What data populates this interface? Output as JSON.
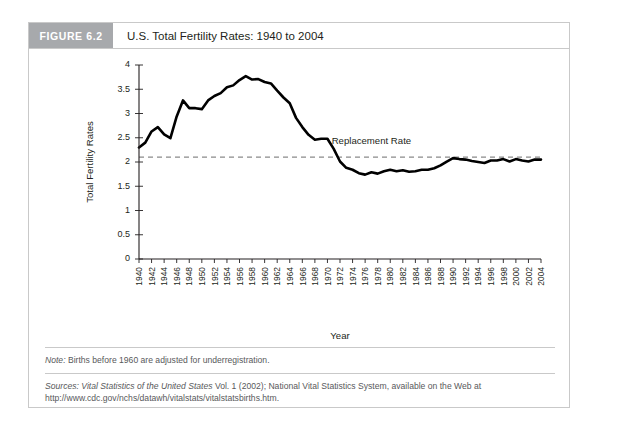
{
  "figure": {
    "badge": "FIGURE 6.2",
    "title": "U.S. Total Fertility Rates: 1940 to 2004",
    "note_label": "Note:",
    "note_text": " Births before 1960 are adjusted for underregistration.",
    "sources_label": "Sources:",
    "sources_italic": " Vital Statistics of the United States",
    "sources_text": " Vol. 1 (2002); National Vital Statistics System, available on the Web at http://www.cdc.gov/nchs/datawh/vitalstats/vitalstatsbirths.htm.",
    "badge_color": "#a7a9ac",
    "line_color": "#000000",
    "ref_line_color": "#8a8a8a"
  },
  "chart_data": {
    "type": "line",
    "title": "U.S. Total Fertility Rates: 1940 to 2004",
    "xlabel": "Year",
    "ylabel": "Total Fertility Rates",
    "xlim": [
      1940,
      2004
    ],
    "ylim": [
      0,
      4
    ],
    "yticks": [
      0,
      0.5,
      1,
      1.5,
      2,
      2.5,
      3,
      3.5,
      4
    ],
    "ytick_labels": [
      "0",
      "0.5",
      "1",
      "1.5",
      "2",
      "2.5",
      "3",
      "3.5",
      "4"
    ],
    "xticks": [
      1940,
      1941,
      1942,
      1943,
      1944,
      1945,
      1946,
      1947,
      1948,
      1949,
      1950,
      1951,
      1952,
      1953,
      1954,
      1955,
      1956,
      1957,
      1958,
      1959,
      1960,
      1961,
      1962,
      1963,
      1964,
      1965,
      1966,
      1967,
      1968,
      1969,
      1970,
      1971,
      1972,
      1973,
      1974,
      1975,
      1976,
      1977,
      1978,
      1979,
      1980,
      1981,
      1982,
      1983,
      1984,
      1985,
      1986,
      1987,
      1988,
      1989,
      1990,
      1991,
      1992,
      1993,
      1994,
      1995,
      1996,
      1997,
      1998,
      1999,
      2000,
      2001,
      2002,
      2003,
      2004
    ],
    "xtick_labels": [
      "1940",
      "1942",
      "1944",
      "1946",
      "1948",
      "1950",
      "1952",
      "1954",
      "1956",
      "1958",
      "1960",
      "1962",
      "1964",
      "1966",
      "1968",
      "1970",
      "1972",
      "1974",
      "1976",
      "1978",
      "1980",
      "1982",
      "1984",
      "1986",
      "1988",
      "1990",
      "1992",
      "1994",
      "1996",
      "1998",
      "2000",
      "2002",
      "2004"
    ],
    "xtick_label_step": 2,
    "grid": false,
    "legend": "none",
    "annotations": [
      {
        "text": "Replacement Rate",
        "x": 1977,
        "y": 2.38
      }
    ],
    "reference_line": {
      "label": "Replacement Rate",
      "y": 2.1,
      "style": "dashed"
    },
    "series": [
      {
        "name": "Total Fertility Rate",
        "x": [
          1940,
          1941,
          1942,
          1943,
          1944,
          1945,
          1946,
          1947,
          1948,
          1949,
          1950,
          1951,
          1952,
          1953,
          1954,
          1955,
          1956,
          1957,
          1958,
          1959,
          1960,
          1961,
          1962,
          1963,
          1964,
          1965,
          1966,
          1967,
          1968,
          1969,
          1970,
          1971,
          1972,
          1973,
          1974,
          1975,
          1976,
          1977,
          1978,
          1979,
          1980,
          1981,
          1982,
          1983,
          1984,
          1985,
          1986,
          1987,
          1988,
          1989,
          1990,
          1991,
          1992,
          1993,
          1994,
          1995,
          1996,
          1997,
          1998,
          1999,
          2000,
          2001,
          2002,
          2003,
          2004
        ],
        "values": [
          2.3,
          2.4,
          2.63,
          2.72,
          2.57,
          2.49,
          2.94,
          3.27,
          3.11,
          3.11,
          3.09,
          3.27,
          3.36,
          3.42,
          3.54,
          3.58,
          3.69,
          3.77,
          3.7,
          3.71,
          3.65,
          3.62,
          3.47,
          3.33,
          3.21,
          2.91,
          2.72,
          2.56,
          2.46,
          2.48,
          2.48,
          2.27,
          2.01,
          1.88,
          1.84,
          1.77,
          1.74,
          1.79,
          1.76,
          1.81,
          1.84,
          1.81,
          1.83,
          1.8,
          1.81,
          1.84,
          1.84,
          1.87,
          1.93,
          2.01,
          2.08,
          2.06,
          2.05,
          2.02,
          2.0,
          1.98,
          2.03,
          2.03,
          2.06,
          2.01,
          2.06,
          2.03,
          2.01,
          2.05,
          2.05
        ]
      }
    ]
  }
}
